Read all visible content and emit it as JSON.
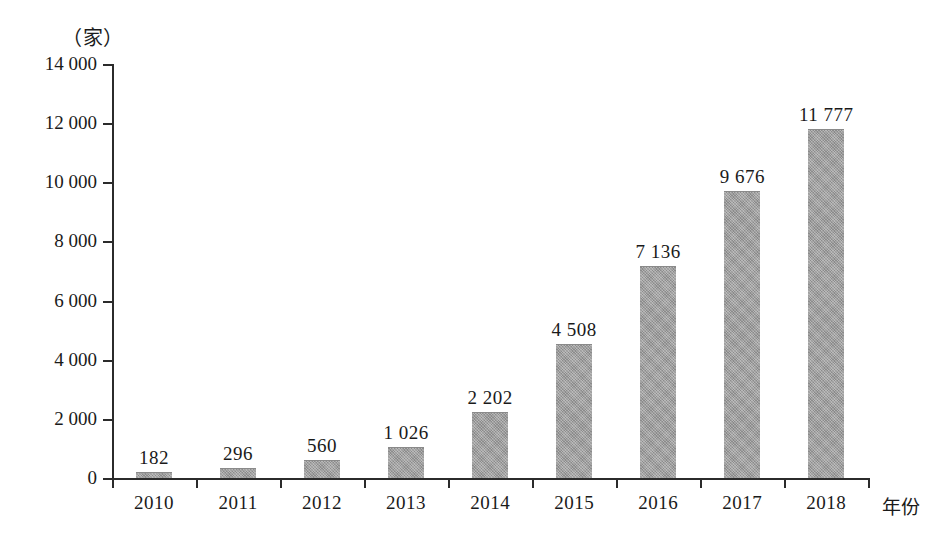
{
  "chart_data": {
    "type": "bar",
    "title": "",
    "subtitle": "",
    "unit_label": "（家）",
    "xlabel": "年份",
    "ylabel": "",
    "categories": [
      "2010",
      "2011",
      "2012",
      "2013",
      "2014",
      "2015",
      "2016",
      "2017",
      "2018"
    ],
    "values": [
      182,
      296,
      560,
      1026,
      2202,
      4508,
      7136,
      9676,
      11777
    ],
    "value_labels": [
      "182",
      "296",
      "560",
      "1 026",
      "2 202",
      "4 508",
      "7 136",
      "9 676",
      "11 777"
    ],
    "ylim": [
      0,
      14000
    ],
    "ytick_values": [
      0,
      2000,
      4000,
      6000,
      8000,
      10000,
      12000,
      14000
    ],
    "ytick_labels": [
      "0",
      "2 000",
      "4 000",
      "6 000",
      "8 000",
      "10 000",
      "12 000",
      "14 000"
    ],
    "grid": false,
    "legend": null,
    "legend_position": "none",
    "series": [
      {
        "name": "",
        "values": [
          182,
          296,
          560,
          1026,
          2202,
          4508,
          7136,
          9676,
          11777
        ]
      }
    ],
    "colors": {
      "bar_fill": "#9b9b9b",
      "axis": "#2b2b2b",
      "text": "#1a1a1a",
      "background": "#ffffff"
    }
  }
}
